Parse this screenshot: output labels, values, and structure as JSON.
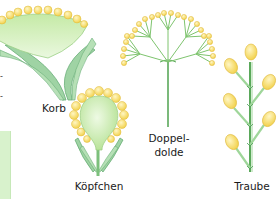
{
  "diagram": {
    "type": "inflorescence-types",
    "colors": {
      "receptacle": "#c9ecb0",
      "receptacle_light": "#e6f7d8",
      "bract": "#7fc08a",
      "flower": "#f7dd6a",
      "flower_light": "#fff3b0",
      "stem": "#5aa85a"
    },
    "items": [
      {
        "id": "korb",
        "label": "Korb"
      },
      {
        "id": "koepfchen",
        "label": "Köpfchen"
      },
      {
        "id": "doppeldolde",
        "label_line1": "Doppel-",
        "label_line2": "dolde"
      },
      {
        "id": "traube",
        "label": "Traube"
      }
    ],
    "left_fragments": [
      "-",
      "-"
    ]
  }
}
